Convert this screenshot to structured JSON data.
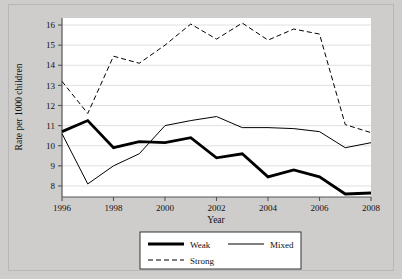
{
  "figure": {
    "background_color": "#cfcdcb",
    "plot_background_color": "#ffffff"
  },
  "chart_data": {
    "type": "line",
    "title": "",
    "xlabel": "Year",
    "ylabel": "Rate per 1000 children",
    "x": [
      1996,
      1997,
      1998,
      1999,
      2000,
      2001,
      2002,
      2003,
      2004,
      2005,
      2006,
      2007,
      2008
    ],
    "xtick_labels": [
      "1996",
      "1998",
      "2000",
      "2002",
      "2004",
      "2006",
      "2008"
    ],
    "xticks": [
      1996,
      1998,
      2000,
      2002,
      2004,
      2006,
      2008
    ],
    "ytick_labels": [
      "8",
      "9",
      "10",
      "11",
      "12",
      "13",
      "14",
      "15",
      "16"
    ],
    "yticks": [
      8,
      9,
      10,
      11,
      12,
      13,
      14,
      15,
      16
    ],
    "xlim": [
      1996,
      2008
    ],
    "ylim": [
      7.45,
      16.35
    ],
    "grid": "horizontal",
    "grid_color": "#d8d8d8",
    "legend_position": "below-axes",
    "series": [
      {
        "name": "Weak",
        "style": "solid",
        "width": 2.8,
        "color": "#000000",
        "values": [
          10.7,
          11.25,
          9.9,
          10.2,
          10.15,
          10.4,
          9.4,
          9.6,
          8.45,
          8.8,
          8.45,
          7.6,
          7.65
        ]
      },
      {
        "name": "Mixed",
        "style": "solid",
        "width": 1.0,
        "color": "#000000",
        "values": [
          10.6,
          8.1,
          9.0,
          9.6,
          11.0,
          11.25,
          11.45,
          10.9,
          10.9,
          10.85,
          10.7,
          9.9,
          10.15
        ]
      },
      {
        "name": "Strong",
        "style": "dashed",
        "width": 1.0,
        "color": "#000000",
        "values": [
          13.2,
          11.6,
          14.45,
          14.1,
          15.0,
          16.05,
          15.3,
          16.1,
          15.25,
          15.8,
          15.55,
          11.05,
          10.65
        ]
      }
    ]
  },
  "legend": {
    "entries": [
      {
        "label": "Weak",
        "style": "thick-solid"
      },
      {
        "label": "Mixed",
        "style": "thin-solid"
      },
      {
        "label": "Strong",
        "style": "dashed"
      }
    ]
  }
}
